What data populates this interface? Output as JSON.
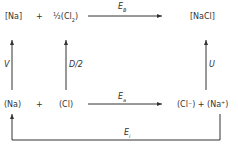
{
  "nodes": {
    "na_solid": "[Na]",
    "plus_top": "+",
    "half": "½",
    "cl2": "(Cl",
    "cl2_sub": "2",
    "cl2_close": ")",
    "nacl_solid": "[NaCl]",
    "na_gas": "(Na)",
    "plus_bottom": "+",
    "cl_gas": "(Cl)",
    "ions": "(Cl⁻) + (Na⁺)"
  },
  "arrows": {
    "formation": {
      "symbol": "E",
      "sub": "B"
    },
    "sublimation": {
      "symbol": "V"
    },
    "dissociation": {
      "symbol": "D/2"
    },
    "lattice": {
      "symbol": "U"
    },
    "electron_affinity": {
      "symbol": "E",
      "sub": "a"
    },
    "ionization": {
      "symbol": "E",
      "sub": "i"
    }
  }
}
